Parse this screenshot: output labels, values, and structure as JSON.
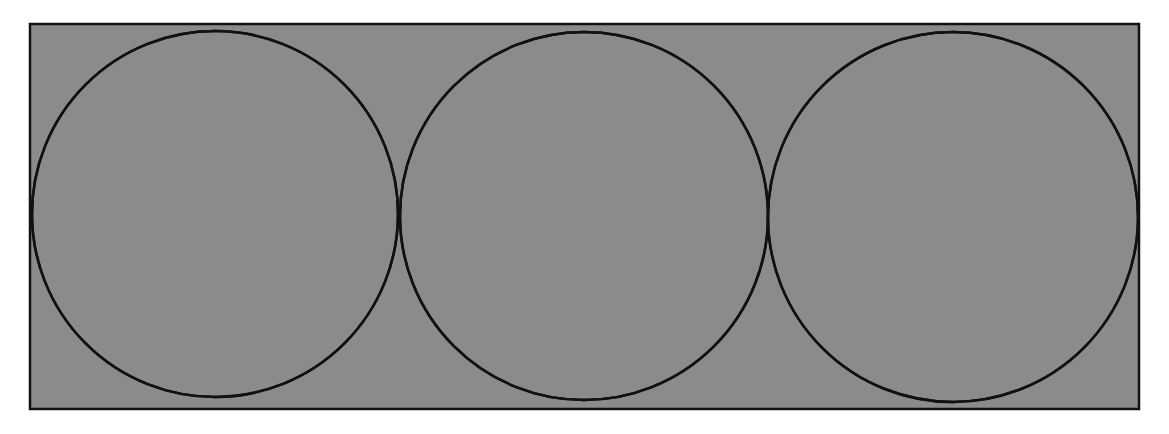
{
  "diagram": {
    "colors": {
      "background": "#ffffff",
      "dark_fill": "#8b8b8b",
      "light_fill": "#d9d9d9",
      "stroke": "#111111"
    },
    "rectangle": {
      "x": 30,
      "y": 24,
      "width": 1109,
      "height": 385
    },
    "circles": [
      {
        "cx": 215,
        "cy": 214,
        "r": 183
      },
      {
        "cx": 584,
        "cy": 216,
        "r": 184
      },
      {
        "cx": 953,
        "cy": 217,
        "r": 185
      }
    ],
    "petals_per_circle": 4
  }
}
